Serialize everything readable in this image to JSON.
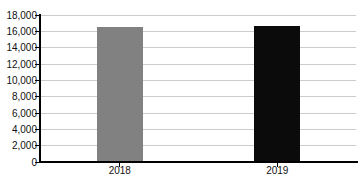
{
  "chart_data": {
    "type": "bar",
    "categories": [
      "2018",
      "2019"
    ],
    "values": [
      16500,
      16700
    ],
    "bar_colors": [
      "#818181",
      "#0b0b0b"
    ],
    "title": "",
    "xlabel": "",
    "ylabel": "",
    "ylim": [
      0,
      18000
    ],
    "ytick_values": [
      0,
      2000,
      4000,
      6000,
      8000,
      10000,
      12000,
      14000,
      16000,
      18000
    ],
    "ytick_labels": [
      "0",
      "2,000",
      "4,000",
      "6,000",
      "8,000",
      "10,000",
      "12,000",
      "14,000",
      "16,000",
      "18,000"
    ],
    "grid": true,
    "legend": false,
    "colors": {
      "gridline": "#cccccc",
      "axis": "#000000",
      "tick": "#000000",
      "text": "#111111",
      "background": "#ffffff"
    }
  }
}
